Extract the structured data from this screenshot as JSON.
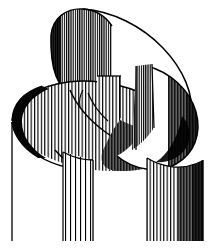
{
  "figure": {
    "style": "vertical-line hatching engraving",
    "colors": {
      "ink": "#000000",
      "paper": "#ffffff",
      "shadow": "#1a1a1a",
      "midtone": "#555555"
    },
    "canvas": {
      "width": 213,
      "height": 251
    },
    "parts": [
      {
        "name": "upper-left-ribbon-band",
        "shading": "dense-hatch-left-dark"
      },
      {
        "name": "upper-right-ellipse-band",
        "shading": "open-hatch"
      },
      {
        "name": "mid-horizontal-ribbon",
        "shading": "graded-hatch"
      },
      {
        "name": "lower-left-cylinder-wall",
        "shading": "sparse-hatch"
      },
      {
        "name": "lower-right-cylinder-wall",
        "shading": "dense-hatch-right-dark"
      },
      {
        "name": "left-contour-line",
        "shading": "outline"
      }
    ]
  },
  "caption": {
    "text": "",
    "cropped": true
  }
}
